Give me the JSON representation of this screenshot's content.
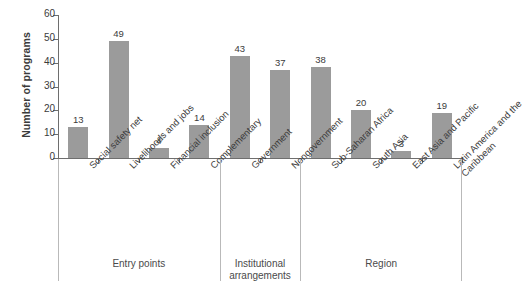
{
  "chart_data": {
    "type": "bar",
    "title": "",
    "subtitle": "",
    "xlabel": "",
    "ylabel": "Number of programs",
    "ylim": [
      0,
      60
    ],
    "ytick_labels": [
      "0",
      "10",
      "20",
      "30",
      "40",
      "50",
      "60"
    ],
    "ytick_values": [
      0,
      10,
      20,
      30,
      40,
      50,
      60
    ],
    "grid": false,
    "legend": "none",
    "bar_color": "#9b9b9b",
    "categories": [
      "Social safety net",
      "Livelihoods and jobs",
      "Financial inclusion",
      "Complementary",
      "Government",
      "Nongovernment",
      "Sub-Saharan Africa",
      "South Asia",
      "East Asia and Pacific",
      "Latin America and the Caribbean"
    ],
    "values": [
      13,
      49,
      4,
      14,
      43,
      37,
      38,
      20,
      3,
      19
    ],
    "value_labels": [
      "13",
      "49",
      "4",
      "14",
      "43",
      "37",
      "38",
      "20",
      "3",
      "19"
    ],
    "groups": [
      {
        "label": "Entry points",
        "categories": 4
      },
      {
        "label": "Institutional arrangements",
        "categories": 2
      },
      {
        "label": "Region",
        "categories": 4
      }
    ]
  }
}
